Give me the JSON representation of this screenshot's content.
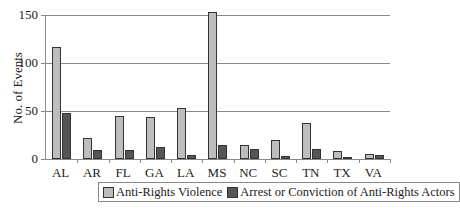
{
  "chart_data": {
    "type": "bar",
    "title": "",
    "xlabel": "",
    "ylabel": "No. of Events",
    "ylim": [
      0,
      150
    ],
    "yticks": [
      0,
      50,
      100,
      150
    ],
    "grid": true,
    "legend_position": "bottom",
    "categories": [
      "AL",
      "AR",
      "FL",
      "GA",
      "LA",
      "MS",
      "NC",
      "SC",
      "TN",
      "TX",
      "VA"
    ],
    "series": [
      {
        "name": "Anti-Rights Violence",
        "color": "#bdbdbd",
        "values": [
          117,
          22,
          45,
          44,
          53,
          154,
          15,
          20,
          37,
          8,
          5
        ]
      },
      {
        "name": "Arrest or Conviction of Anti-Rights Actors",
        "color": "#555555",
        "values": [
          48,
          9,
          9,
          13,
          4,
          15,
          10,
          3,
          10,
          2,
          4
        ]
      }
    ]
  },
  "labels": {
    "ylabel": "No. of Events",
    "yticks": [
      "0",
      "50",
      "100",
      "150"
    ],
    "legend": [
      "Anti-Rights Violence",
      "Arrest or Conviction of Anti-Rights Actors"
    ]
  }
}
